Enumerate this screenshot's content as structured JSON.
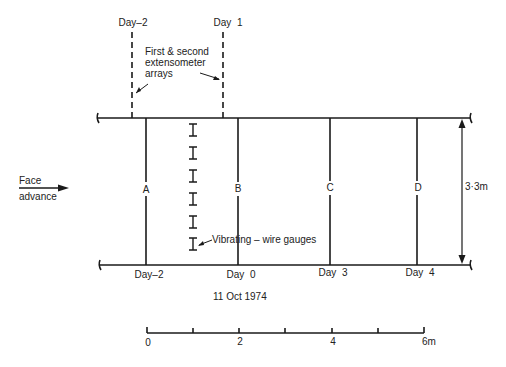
{
  "diagram": {
    "top_labels": {
      "dashed_left": "Day–2",
      "dashed_right": "Day  1"
    },
    "annotation_extensometer": [
      "First & second",
      "extensometer",
      "arrays"
    ],
    "face_advance": [
      "Face",
      "advance"
    ],
    "section_letters": [
      "A",
      "B",
      "C",
      "D"
    ],
    "bottom_day_labels": [
      "Day–2",
      "Day  0",
      "Day  3",
      "Day  4"
    ],
    "date_label": "11 Oct 1974",
    "gauges_label": "Vibrating – wire gauges",
    "gauge_count": 6,
    "height_dimension": "3·3m",
    "scale_bar": {
      "ticks": [
        "0",
        "2",
        "4",
        "6m"
      ],
      "minor_ticks": 6
    },
    "colors": {
      "line": "#1a1a1a",
      "background": "#ffffff"
    }
  }
}
